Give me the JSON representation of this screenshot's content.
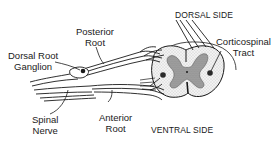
{
  "diagram": {
    "labels": {
      "dorsal_side": "DORSAL SIDE",
      "ventral_side": "VENTRAL SIDE",
      "posterior_root": [
        "Posterior",
        "Root"
      ],
      "dorsal_root_ganglion": [
        "Dorsal Root",
        "Ganglion"
      ],
      "corticospinal_tract": [
        "Corticospinal",
        "Tract"
      ],
      "spinal_nerve": [
        "Spinal",
        "Nerve"
      ],
      "anterior_root": [
        "Anterior",
        "Root"
      ]
    },
    "colors": {
      "ink": "#1a1a1a",
      "background": "#ffffff",
      "grey_matter": "#8a8a8a",
      "white_matter": "#e6e6e6"
    }
  }
}
